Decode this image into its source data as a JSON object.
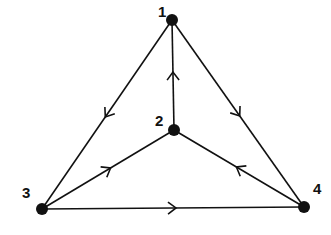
{
  "diagram": {
    "type": "directed-graph",
    "nodes": [
      {
        "id": "1",
        "label": "1",
        "x": 172,
        "y": 20,
        "label_x": 158,
        "label_y": 17
      },
      {
        "id": "2",
        "label": "2",
        "x": 174,
        "y": 130,
        "label_x": 155,
        "label_y": 126
      },
      {
        "id": "3",
        "label": "3",
        "x": 42,
        "y": 209,
        "label_x": 22,
        "label_y": 198
      },
      {
        "id": "4",
        "label": "4",
        "x": 304,
        "y": 207,
        "label_x": 313,
        "label_y": 194
      }
    ],
    "edges": [
      {
        "from": "2",
        "to": "1"
      },
      {
        "from": "1",
        "to": "3"
      },
      {
        "from": "1",
        "to": "4"
      },
      {
        "from": "3",
        "to": "2"
      },
      {
        "from": "4",
        "to": "2"
      },
      {
        "from": "3",
        "to": "4"
      }
    ],
    "colors": {
      "stroke": "#111111",
      "node": "#111111",
      "background": "#ffffff"
    }
  }
}
